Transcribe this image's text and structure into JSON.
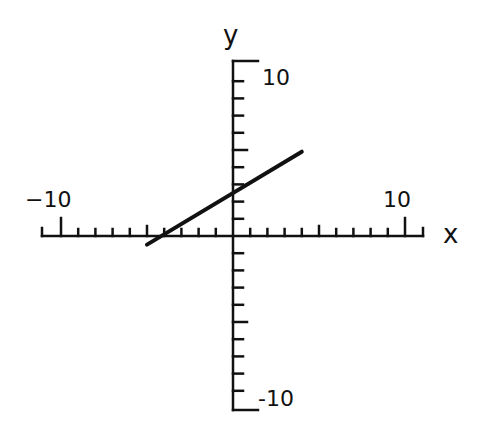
{
  "chart_data": {
    "type": "line",
    "title": "",
    "xlabel": "x",
    "ylabel": "y",
    "xlim": [
      -10,
      10
    ],
    "ylim": [
      -10,
      10
    ],
    "grid": false,
    "x_ticks": {
      "minor_step": 1,
      "major_step": 5,
      "labels": [
        {
          "value": -10,
          "text": "−10"
        },
        {
          "value": 10,
          "text": "10"
        }
      ]
    },
    "y_ticks": {
      "minor_step": 1,
      "major_step": 5,
      "labels": [
        {
          "value": 10,
          "text": "10"
        },
        {
          "value": -10,
          "text": "-10"
        }
      ]
    },
    "series": [
      {
        "name": "line",
        "x": [
          -5,
          4
        ],
        "y": [
          -0.5,
          4.9
        ],
        "approx_equation": "y = 0.6x + 2.5",
        "color": "#111111"
      }
    ]
  },
  "labels": {
    "x_axis": "x",
    "y_axis": "y",
    "x_min": "−10",
    "x_max": "10",
    "y_max": "10",
    "y_min": "-10"
  },
  "colors": {
    "ink": "#111111",
    "background": "#ffffff"
  }
}
